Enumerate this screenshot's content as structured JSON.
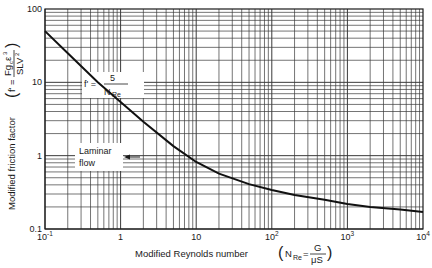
{
  "chart_data": {
    "type": "line",
    "title": "",
    "xlabel": "Modified Reynolds number",
    "xlabel_formula": {
      "lhs": "N'Re",
      "numerator": "G",
      "denominator": "μS"
    },
    "ylabel": "Modified friction factor",
    "ylabel_formula": {
      "lhs": "f'",
      "numerator": "Fgcε³",
      "denominator": "SLV²"
    },
    "xscale": "log",
    "yscale": "log",
    "xlim": [
      0.1,
      10000
    ],
    "ylim": [
      0.1,
      100
    ],
    "grid": true,
    "x_ticks": [
      {
        "value": 0.1,
        "base": "10",
        "exp": "-1"
      },
      {
        "value": 1,
        "base": "1",
        "exp": ""
      },
      {
        "value": 10,
        "base": "10",
        "exp": ""
      },
      {
        "value": 100,
        "base": "10",
        "exp": "2"
      },
      {
        "value": 1000,
        "base": "10",
        "exp": "3"
      },
      {
        "value": 10000,
        "base": "10",
        "exp": "4"
      }
    ],
    "y_ticks": [
      {
        "value": 100,
        "label": "100"
      },
      {
        "value": 10,
        "label": "10"
      },
      {
        "value": 1,
        "label": "1"
      },
      {
        "value": 0.1,
        "label": "0.1"
      }
    ],
    "series": [
      {
        "name": "Modified friction factor curve",
        "x": [
          0.1,
          0.2,
          0.5,
          1,
          2,
          5,
          10,
          20,
          50,
          100,
          200,
          500,
          1000,
          2000,
          5000,
          10000
        ],
        "y": [
          50,
          25,
          10,
          5.4,
          2.9,
          1.35,
          0.82,
          0.57,
          0.41,
          0.34,
          0.29,
          0.25,
          0.22,
          0.2,
          0.185,
          0.17
        ]
      }
    ],
    "annotations": [
      {
        "text_lhs": "f' =",
        "numerator": "5",
        "denominator": "N'Re",
        "x": 0.7,
        "y": 12
      },
      {
        "text": [
          "Laminar",
          "flow"
        ],
        "arrow": "left",
        "x": 0.3,
        "y": 1
      }
    ]
  },
  "labels": {
    "x_axis": "Modified Reynolds number",
    "y_axis": "Modified friction factor",
    "laminar_line1": "Laminar",
    "laminar_line2": "flow",
    "eq_lhs": "f' =",
    "eq_num": "5",
    "eq_den": "N",
    "eq_den_sub": "Re",
    "x_formula_lhs": "N",
    "x_formula_sub": "Re",
    "x_formula_num": "G",
    "x_formula_den": "μS",
    "y_formula_lhs": "f' =",
    "y_formula_num": "Fg",
    "y_formula_num_sub": "c",
    "y_formula_num_tail": "ε",
    "y_formula_num_sup": "3",
    "y_formula_den": "SLV",
    "y_formula_den_sup": "2"
  },
  "colors": {
    "ink": "#1a1a1a",
    "grid": "#3a3a3a",
    "background": "#ffffff"
  }
}
